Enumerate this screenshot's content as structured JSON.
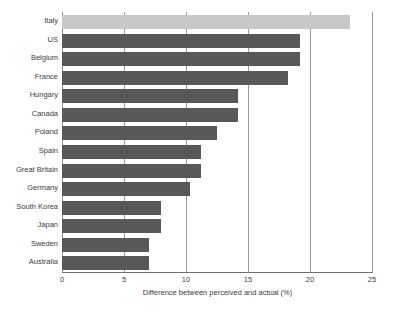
{
  "chart_data": {
    "type": "bar",
    "orientation": "horizontal",
    "title": "",
    "xlabel": "Difference between perceived and actual (%)",
    "ylabel": "",
    "xlim": [
      0,
      25
    ],
    "xticks": [
      0,
      5,
      10,
      15,
      20,
      25
    ],
    "grid": "vertical",
    "legend": "none",
    "categories": [
      "Italy",
      "US",
      "Belgium",
      "France",
      "Hungary",
      "Canada",
      "Poland",
      "Spain",
      "Great Britain",
      "Germany",
      "South Korea",
      "Japan",
      "Sweden",
      "Australia"
    ],
    "values": [
      23.2,
      19.2,
      19.2,
      18.2,
      14.2,
      14.2,
      12.5,
      11.2,
      11.2,
      10.3,
      8.0,
      8.0,
      7.0,
      7.0
    ],
    "highlight_index": 0,
    "colors": {
      "bar": "#585858",
      "bar_highlight": "#c8c8c8",
      "gridline": "#9a9a9a",
      "axis": "#6f6f6f",
      "text": "#3c3c3c",
      "background": "#ffffff"
    }
  }
}
